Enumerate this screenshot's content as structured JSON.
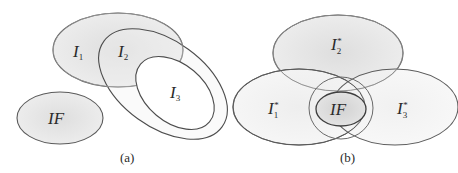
{
  "figure": {
    "panel_a": {
      "caption": "(a)",
      "sets": [
        {
          "id": "I1",
          "base": "I",
          "sub": "1",
          "sup": ""
        },
        {
          "id": "I2",
          "base": "I",
          "sub": "2",
          "sup": ""
        },
        {
          "id": "I3",
          "base": "I",
          "sub": "3",
          "sup": ""
        },
        {
          "id": "IF",
          "base": "IF",
          "sub": "",
          "sup": ""
        }
      ]
    },
    "panel_b": {
      "caption": "(b)",
      "sets": [
        {
          "id": "I2star",
          "base": "I",
          "sub": "2",
          "sup": "*"
        },
        {
          "id": "I1star",
          "base": "I",
          "sub": "1",
          "sup": "*"
        },
        {
          "id": "I3star",
          "base": "I",
          "sub": "3",
          "sup": "*"
        },
        {
          "id": "IF",
          "base": "IF",
          "sub": "",
          "sup": ""
        }
      ]
    },
    "colors": {
      "stroke": "#5a5a5a",
      "fill_shaded": "#e6e6e6",
      "fill_light": "#f2f2f2",
      "fill_if": "#dcdcdc"
    }
  }
}
